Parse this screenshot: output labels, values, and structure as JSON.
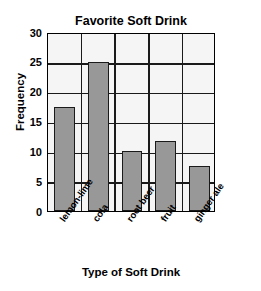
{
  "chart_data": {
    "type": "bar",
    "title": "Favorite Soft Drink",
    "xlabel": "Type of Soft Drink",
    "ylabel": "Frequency",
    "categories": [
      "lemon-lime",
      "cola",
      "root beer",
      "fruit",
      "ginger ale"
    ],
    "values": [
      17.5,
      25,
      10,
      11.8,
      7.5
    ],
    "ylim": [
      0,
      30
    ],
    "yticks": [
      0,
      5,
      10,
      15,
      20,
      25,
      30
    ],
    "ytick_labels": [
      "0",
      "5",
      "10",
      "15",
      "20",
      "25",
      "30"
    ],
    "grid": true,
    "grid_axis": "y",
    "legend": false,
    "bar_color": "#989898",
    "bar_edge_color": "#1a1a1a",
    "plot_background": "#f5f5f5",
    "axis_color": "#000000",
    "text_color": "#000000",
    "xtick_rotation": -55
  }
}
